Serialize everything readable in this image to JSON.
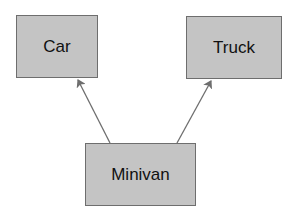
{
  "diagram": {
    "type": "class-inheritance",
    "nodes": [
      {
        "id": "car",
        "label": "Car"
      },
      {
        "id": "truck",
        "label": "Truck"
      },
      {
        "id": "minivan",
        "label": "Minivan"
      }
    ],
    "edges": [
      {
        "from": "minivan",
        "to": "car",
        "style": "arrow"
      },
      {
        "from": "minivan",
        "to": "truck",
        "style": "arrow"
      }
    ],
    "colors": {
      "box_fill": "#c4c4c4",
      "box_border": "#6e6e6e",
      "arrow": "#6e6e6e",
      "text": "#111111"
    }
  }
}
